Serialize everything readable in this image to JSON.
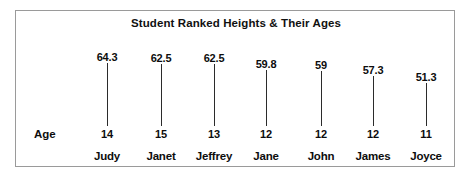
{
  "chart": {
    "title": "Student Ranked Heights & Their Ages",
    "age_axis_label": "Age",
    "border_color": "#9a9a9a",
    "stem_color": "#2b2b2b",
    "text_color": "#0d0d0d",
    "background": "#ffffff"
  },
  "chart_data": {
    "type": "bar",
    "title": "Student Ranked Heights & Their Ages",
    "xlabel": "",
    "ylabel": "",
    "categories": [
      "Judy",
      "Janet",
      "Jeffrey",
      "Jane",
      "John",
      "James",
      "Joyce"
    ],
    "values": [
      64.3,
      62.5,
      62.5,
      59.8,
      59,
      57.3,
      51.3
    ],
    "value_labels": [
      "64.3",
      "62.5",
      "62.5",
      "59.8",
      "59",
      "57.3",
      "51.3"
    ],
    "series": [
      {
        "name": "Height",
        "values": [
          64.3,
          62.5,
          62.5,
          59.8,
          59,
          57.3,
          51.3
        ]
      },
      {
        "name": "Age",
        "values": [
          14,
          15,
          13,
          12,
          12,
          12,
          11
        ]
      }
    ],
    "age_labels": [
      "14",
      "15",
      "13",
      "12",
      "12",
      "12",
      "11"
    ],
    "grid": false,
    "legend": false,
    "ylim": [
      51.3,
      64.3
    ]
  },
  "students": [
    {
      "name": "Judy",
      "height": "64.3",
      "age": "14",
      "x": 91,
      "label_top": 40,
      "stem_top": 52
    },
    {
      "name": "Janet",
      "height": "62.5",
      "age": "15",
      "x": 145,
      "label_top": 41,
      "stem_top": 53
    },
    {
      "name": "Jeffrey",
      "height": "62.5",
      "age": "13",
      "x": 198,
      "label_top": 41,
      "stem_top": 53
    },
    {
      "name": "Jane",
      "height": "59.8",
      "age": "12",
      "x": 250,
      "label_top": 47,
      "stem_top": 59
    },
    {
      "name": "John",
      "height": "59",
      "age": "12",
      "x": 305,
      "label_top": 48,
      "stem_top": 60
    },
    {
      "name": "James",
      "height": "57.3",
      "age": "12",
      "x": 357,
      "label_top": 53,
      "stem_top": 65
    },
    {
      "name": "Joyce",
      "height": "51.3",
      "age": "11",
      "x": 410,
      "label_top": 60,
      "stem_top": 72
    }
  ]
}
